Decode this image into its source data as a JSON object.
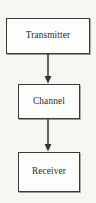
{
  "diagram": {
    "background_color": "#f7f6f3",
    "line_color": "#333331",
    "box_fill_color": "#fdfdfc",
    "text_color": "#2e2c2a",
    "nodes": [
      {
        "id": "transmitter",
        "label": "Transmitter"
      },
      {
        "id": "channel",
        "label": "Channel"
      },
      {
        "id": "receiver",
        "label": "Receiver"
      }
    ],
    "edges": [
      {
        "id": "transmitter-to-channel",
        "from": "Transmitter",
        "to": "Channel",
        "arrow": "down"
      },
      {
        "id": "channel-to-receiver",
        "from": "Channel",
        "to": "Receiver",
        "arrow": "down"
      }
    ]
  }
}
